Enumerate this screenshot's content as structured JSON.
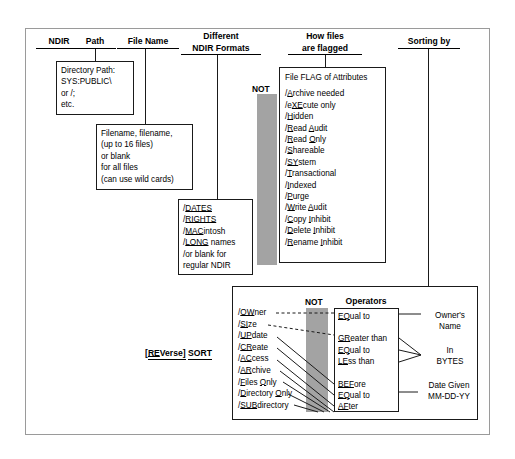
{
  "diagram": {
    "accent_gray": "#a3a3a3",
    "line_color": "#1a1a1a"
  },
  "headers": {
    "ndir": "NDIR",
    "path": "Path",
    "file_name": "File Name",
    "formats_line1": "Different",
    "formats_line2": "NDIR Formats",
    "flagged_line1": "How files",
    "flagged_line2": "are flagged",
    "sorting_by": "Sorting by"
  },
  "not_labels": {
    "top": "NOT",
    "bottom": "NOT"
  },
  "path_box": {
    "lines": [
      "Directory Path:",
      "SYS:PUBLIC\\",
      "or /;",
      "etc."
    ]
  },
  "filename_box": {
    "lines": [
      "Filename, filename,",
      "(up to 16 files)",
      "or blank",
      "for all files",
      "(can use wild cards)"
    ]
  },
  "formats_box": {
    "items": [
      {
        "slash": "/",
        "mnemonic": "DATES",
        "rest": ""
      },
      {
        "slash": "/",
        "mnemonic": "RIGHTS",
        "rest": ""
      },
      {
        "slash": "/",
        "mnemonic": "MAC",
        "rest": "intosh"
      },
      {
        "slash": "/",
        "mnemonic": "LONG",
        "rest": " names"
      },
      {
        "slash": "/",
        "mnemonic": "",
        "rest": "or blank for"
      },
      {
        "slash": "",
        "mnemonic": "",
        "rest": "regular NDIR"
      }
    ]
  },
  "flags_box": {
    "title": "File FLAG of Attributes",
    "items": [
      {
        "pre": "/",
        "m1": "A",
        "t1": "rchive needed",
        "m2": "",
        "t2": ""
      },
      {
        "pre": "/e",
        "m1": "XE",
        "t1": "cute only",
        "m2": "",
        "t2": ""
      },
      {
        "pre": "/",
        "m1": "H",
        "t1": "idden",
        "m2": "",
        "t2": ""
      },
      {
        "pre": "/",
        "m1": "R",
        "t1": "ead ",
        "m2": "A",
        "t2": "udit"
      },
      {
        "pre": "/",
        "m1": "R",
        "t1": "ead ",
        "m2": "O",
        "t2": "nly"
      },
      {
        "pre": "/",
        "m1": "S",
        "t1": "hareable",
        "m2": "",
        "t2": ""
      },
      {
        "pre": "/",
        "m1": "SY",
        "t1": "stem",
        "m2": "",
        "t2": ""
      },
      {
        "pre": "/",
        "m1": "T",
        "t1": "ransactional",
        "m2": "",
        "t2": ""
      },
      {
        "pre": "/",
        "m1": "I",
        "t1": "ndexed",
        "m2": "",
        "t2": ""
      },
      {
        "pre": "/",
        "m1": "P",
        "t1": "urge",
        "m2": "",
        "t2": ""
      },
      {
        "pre": "/",
        "m1": "W",
        "t1": "rite ",
        "m2": "A",
        "t2": "udit"
      },
      {
        "pre": "/",
        "m1": "C",
        "t1": "opy ",
        "m2": "I",
        "t2": "nhibit"
      },
      {
        "pre": "/",
        "m1": "D",
        "t1": "elete ",
        "m2": "I",
        "t2": "nhibit"
      },
      {
        "pre": "/",
        "m1": "R",
        "t1": "ename ",
        "m2": "I",
        "t2": "nhibit"
      }
    ]
  },
  "sort_label": {
    "bracket": "[RE",
    "bracket_m": "RE",
    "full": "[REVerse] SORT",
    "part1_pre": "[",
    "part1_m": "RE",
    "part1_post": "Verse]",
    "part2": "SORT"
  },
  "sort_fields": [
    {
      "pre": "/",
      "m": "OW",
      "t": "ner"
    },
    {
      "pre": "/",
      "m": "SI",
      "t": "ze"
    },
    {
      "pre": "/",
      "m": "UP",
      "t": "date"
    },
    {
      "pre": "/",
      "m": "CR",
      "t": "eate"
    },
    {
      "pre": "/",
      "m": "AC",
      "t": "cess"
    },
    {
      "pre": "/",
      "m": "AR",
      "t": "chive"
    },
    {
      "pre": "/",
      "m": "F",
      "t": "iles ",
      "m2": "O",
      "t2": "nly"
    },
    {
      "pre": "/",
      "m": "D",
      "t": "irectory ",
      "m2": "O",
      "t2": "nly"
    },
    {
      "pre": "/",
      "m": "SUB",
      "t": "directory"
    }
  ],
  "operators": {
    "title": "Operators",
    "items": [
      {
        "m": "EQ",
        "t": "ual to"
      },
      {
        "m": "GR",
        "t": "eater than"
      },
      {
        "m": "EQ",
        "t": "ual to"
      },
      {
        "m": "LE",
        "t": "ss than"
      },
      {
        "m": "BEF",
        "t": "ore"
      },
      {
        "m": "EQ",
        "t": "ual to"
      },
      {
        "m": "AF",
        "t": "ter"
      }
    ]
  },
  "results": {
    "owner": [
      "Owner's",
      "Name"
    ],
    "bytes": [
      "In",
      "BYTES"
    ],
    "date": [
      "Date Given",
      "MM-DD-YY"
    ]
  }
}
